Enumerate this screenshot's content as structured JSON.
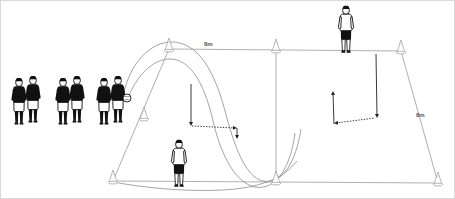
{
  "diagram": {
    "background_color": "#ffffff",
    "border_color": "#d9d9d9",
    "line_color": "#8a8a8a",
    "arc_color": "#7a7a7a",
    "arrow_color": "#333333",
    "kit": {
      "queue_shirt_color": "#111111",
      "queue_shorts_color": "#ffffff",
      "worker_shirt_color": "#ffffff",
      "worker_shorts_color": "#111111",
      "skin_color": "#f2f2f2",
      "outline_color": "#111111",
      "ball_color": "#ffffff"
    },
    "labels": [
      {
        "id": "top-width",
        "text": "8m",
        "x": 203,
        "y": 40
      },
      {
        "id": "right-depth",
        "text": "8m",
        "x": 415,
        "y": 111
      }
    ],
    "grid": {
      "name": "perspective-rectangle",
      "top_left": {
        "x": 168,
        "y": 48
      },
      "top_mid": {
        "x": 275,
        "y": 49
      },
      "top_right": {
        "x": 400,
        "y": 50
      },
      "bottom_left": {
        "x": 112,
        "y": 180
      },
      "bottom_mid": {
        "x": 275,
        "y": 181
      },
      "bottom_right": {
        "x": 437,
        "y": 182
      },
      "center_line": true
    },
    "cones": [
      {
        "id": "cone-top-left",
        "x": 168,
        "y": 48
      },
      {
        "id": "cone-top-mid",
        "x": 275,
        "y": 49
      },
      {
        "id": "cone-top-right",
        "x": 400,
        "y": 50
      },
      {
        "id": "cone-bottom-left",
        "x": 112,
        "y": 180
      },
      {
        "id": "cone-bottom-mid",
        "x": 275,
        "y": 181
      },
      {
        "id": "cone-bottom-right",
        "x": 437,
        "y": 182
      },
      {
        "id": "cone-inner-left",
        "x": 143,
        "y": 117
      }
    ],
    "players": {
      "queue": {
        "count": 6,
        "description": "three pairs of players waiting in line, dark shirts, light shorts",
        "pairs": [
          {
            "id": "queue-pair-1",
            "x": 14,
            "y": 78
          },
          {
            "id": "queue-pair-2",
            "x": 56,
            "y": 78
          },
          {
            "id": "queue-pair-3",
            "x": 96,
            "y": 78
          }
        ],
        "has_ball": true,
        "ball": {
          "x": 128,
          "y": 97,
          "r": 4
        }
      },
      "worker_front": {
        "id": "player-server-front",
        "x": 168,
        "y": 140
      },
      "worker_back": {
        "id": "player-server-back",
        "x": 336,
        "y": 8
      }
    },
    "trajectories": [
      {
        "id": "ball-arc-outer",
        "description": "long lofted ball from queue over the far cone"
      },
      {
        "id": "ball-arc-inner",
        "description": "second lofted ball arc returning to the grid"
      }
    ],
    "movement_arrows": [
      {
        "id": "arrow-dotted-left",
        "style": "dotted",
        "from": {
          "x": 190,
          "y": 124
        },
        "to": {
          "x": 236,
          "y": 127
        }
      },
      {
        "id": "arrow-solid-left-drop",
        "style": "solid",
        "from": {
          "x": 190,
          "y": 83
        },
        "to": {
          "x": 190,
          "y": 124
        }
      },
      {
        "id": "arrow-solid-left-down",
        "style": "solid",
        "from": {
          "x": 236,
          "y": 127
        },
        "to": {
          "x": 236,
          "y": 137
        }
      },
      {
        "id": "arrow-dotted-right",
        "style": "dotted",
        "from": {
          "x": 333,
          "y": 122
        },
        "to": {
          "x": 375,
          "y": 117
        }
      },
      {
        "id": "arrow-solid-right-up",
        "style": "solid",
        "from": {
          "x": 333,
          "y": 92
        },
        "to": {
          "x": 333,
          "y": 122
        }
      },
      {
        "id": "arrow-solid-right-down",
        "style": "solid",
        "from": {
          "x": 375,
          "y": 52
        },
        "to": {
          "x": 375,
          "y": 117
        }
      }
    ]
  }
}
